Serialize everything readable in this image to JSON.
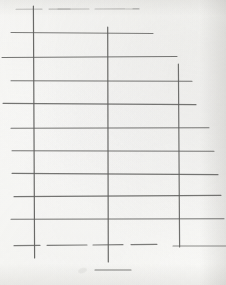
{
  "document": {
    "kind": "scanned-paper-sheet",
    "title": "Hand-drawn pencil grid on paper",
    "has_text": false,
    "background_color": "#fdfdfb",
    "ink_color": "#5a5a58",
    "width": 226,
    "height": 285
  },
  "drawing": {
    "description": "Ruled grid skeleton drawn in pencil: three long vertical rules crossed by eleven horizontal rules of varying length, plus a short tick-cross below the sheet body.",
    "stroke_color": "#5e5e5c",
    "stroke_color_faint": "#a8a8a4",
    "stroke_width": 1.1,
    "vertical_lines": [
      {
        "name": "vertical-rule-left",
        "x": 34,
        "y1": 6,
        "y2": 258,
        "opacity": 0.92
      },
      {
        "name": "vertical-rule-middle",
        "x": 108,
        "y1": 27,
        "y2": 262,
        "opacity": 0.92
      },
      {
        "name": "vertical-rule-right",
        "x": 179,
        "y1": 64,
        "y2": 247,
        "opacity": 0.88
      }
    ],
    "horizontal_lines": [
      {
        "name": "horizontal-rule-1",
        "y": 9,
        "x1": 16,
        "x2": 139,
        "opacity": 0.34,
        "dashed": true
      },
      {
        "name": "horizontal-rule-2",
        "y": 33,
        "x1": 11,
        "x2": 153,
        "opacity": 0.8
      },
      {
        "name": "horizontal-rule-3",
        "y": 57,
        "x1": 2,
        "x2": 177,
        "opacity": 0.85
      },
      {
        "name": "horizontal-rule-4",
        "y": 81,
        "x1": 11,
        "x2": 192,
        "opacity": 0.85
      },
      {
        "name": "horizontal-rule-5",
        "y": 104,
        "x1": 3,
        "x2": 196,
        "opacity": 0.85
      },
      {
        "name": "horizontal-rule-6",
        "y": 128,
        "x1": 11,
        "x2": 209,
        "opacity": 0.85
      },
      {
        "name": "horizontal-rule-7",
        "y": 151,
        "x1": 12,
        "x2": 214,
        "opacity": 0.85
      },
      {
        "name": "horizontal-rule-8",
        "y": 174,
        "x1": 12,
        "x2": 218,
        "opacity": 0.85
      },
      {
        "name": "horizontal-rule-9",
        "y": 196,
        "x1": 14,
        "x2": 221,
        "opacity": 0.85
      },
      {
        "name": "horizontal-rule-10",
        "y": 219,
        "x1": 11,
        "x2": 224,
        "opacity": 0.85
      },
      {
        "name": "horizontal-rule-11",
        "y": 245,
        "x1": 14,
        "x2": 158,
        "opacity": 0.8,
        "dashed": true
      }
    ],
    "extra_marks": [
      {
        "name": "tick-cross-horizontal",
        "y": 270,
        "x1": 95,
        "x2": 131,
        "opacity": 0.78
      },
      {
        "name": "baseline-right-segment",
        "y": 246,
        "x1": 173,
        "x2": 226,
        "opacity": 0.7
      },
      {
        "name": "top-faint-dash-a",
        "y": 9,
        "x1": 58,
        "x2": 70,
        "opacity": 0.3
      },
      {
        "name": "top-faint-dash-b",
        "y": 9,
        "x1": 126,
        "x2": 139,
        "opacity": 0.3
      },
      {
        "name": "pencil-smudge",
        "x": 78,
        "y": 268,
        "opacity": 0.3
      }
    ],
    "cell_counts": {
      "columns": 4,
      "rows": 11
    }
  }
}
